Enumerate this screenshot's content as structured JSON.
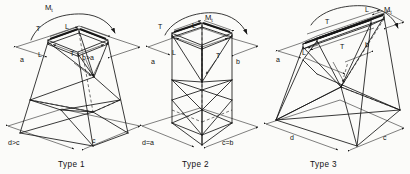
{
  "figure": {
    "background_color": "#fbfbf9",
    "line_color": "#171717",
    "panel_count": 3
  },
  "panels": [
    {
      "id": "type-1",
      "caption": "Type 1",
      "moment_label": "M",
      "moment_subscript": "t",
      "top_width_label": "L",
      "top_depth_label": "T",
      "inner_depth_label": "L",
      "inner_width_label": "T",
      "dim_top_left": "a",
      "dim_top_right": "b>a",
      "dim_base_left": "d>c",
      "dim_base_right": "c",
      "shape": "tapered-battered-lattice-tower",
      "top_face": "rhombus",
      "notes": "Top plan smaller than base; all four faces battered outward"
    },
    {
      "id": "type-2",
      "caption": "Type 2",
      "moment_label": "M",
      "moment_subscript": "t",
      "top_width_label": "L",
      "top_depth_label": "T",
      "inner_depth_label": "L",
      "inner_width_label": "T",
      "dim_top_left": "a",
      "dim_top_right": "b",
      "dim_base_left": "d=a",
      "dim_base_right": "c=b",
      "shape": "prismatic-vertical-lattice-tower",
      "top_face": "rhombus",
      "notes": "Vertical faces; base plan equals top plan"
    },
    {
      "id": "type-3",
      "caption": "Type 3",
      "moment_label": "M",
      "moment_subscript": "t",
      "top_width_label": "L",
      "top_depth_label": "T",
      "inner_depth_label": "L",
      "inner_width_label": "T",
      "dim_top_left": "a",
      "dim_top_right": "b",
      "dim_base_left": "d",
      "dim_base_right": "c",
      "shape": "narrow-top-wide-base-lattice-tower",
      "top_face": "elongated-rhombus",
      "notes": "Narrow rectangular top, strongly flared base"
    }
  ],
  "symbols": {
    "moment": "M t  (applied torsional moment, curved double arrow)",
    "transverse_force": "T",
    "longitudinal_force": "L",
    "dimension_a": "a",
    "dimension_b": "b",
    "dimension_c": "c",
    "dimension_d": "d",
    "relation_gt": ">",
    "relation_eq": "="
  }
}
